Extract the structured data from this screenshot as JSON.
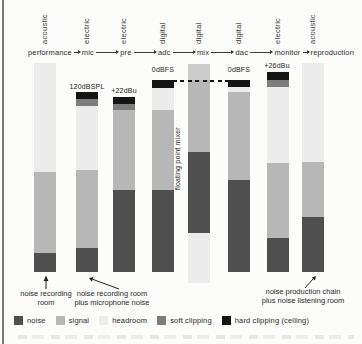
{
  "figure": {
    "background": "#fcfcfb",
    "floating_point_mixer_label": "floating point mixer"
  },
  "chart_data": {
    "type": "bar",
    "subtype": "stacked-level-diagram",
    "title": "",
    "categories": [
      "performance",
      "mic",
      "pre",
      "adc",
      "mix",
      "dac",
      "monitor",
      "reproduction"
    ],
    "domain_labels": [
      "acoustic",
      "electric",
      "electric",
      "digital",
      "digital",
      "digital",
      "electric",
      "acoustic"
    ],
    "legend_entries": [
      "noise",
      "signal",
      "headroom",
      "soft clipping",
      "hard clipping (ceiling)"
    ],
    "colors": {
      "noise": "#4f4f4f",
      "signal": "#b7b7b7",
      "headroom": "#ececec",
      "soft": "#7d7d7d",
      "hard": "#141414",
      "over": "#cccccc"
    },
    "bars": [
      {
        "stage": "performance",
        "x": 34,
        "width": 22,
        "annotation": null,
        "segments": [
          {
            "kind": "headroom",
            "top": 63,
            "bottom": 172
          },
          {
            "kind": "signal",
            "top": 172,
            "bottom": 253
          },
          {
            "kind": "noise",
            "top": 253,
            "bottom": 272
          }
        ]
      },
      {
        "stage": "mic",
        "x": 76,
        "width": 22,
        "annotation": {
          "label": "120dBSPL",
          "x": 87,
          "y": 83
        },
        "segments": [
          {
            "kind": "hard",
            "top": 92,
            "bottom": 99
          },
          {
            "kind": "soft",
            "top": 99,
            "bottom": 106
          },
          {
            "kind": "headroom",
            "top": 106,
            "bottom": 170
          },
          {
            "kind": "signal",
            "top": 170,
            "bottom": 248
          },
          {
            "kind": "noise",
            "top": 248,
            "bottom": 272
          }
        ]
      },
      {
        "stage": "pre",
        "x": 113,
        "width": 22,
        "annotation": {
          "label": "+22dBu",
          "x": 124,
          "y": 87
        },
        "segments": [
          {
            "kind": "hard",
            "top": 97,
            "bottom": 104
          },
          {
            "kind": "soft",
            "top": 104,
            "bottom": 110
          },
          {
            "kind": "signal",
            "top": 110,
            "bottom": 190
          },
          {
            "kind": "noise",
            "top": 190,
            "bottom": 272
          }
        ]
      },
      {
        "stage": "adc",
        "x": 152,
        "width": 22,
        "annotation": {
          "label": "0dBFS",
          "x": 163,
          "y": 66
        },
        "segments": [
          {
            "kind": "hard",
            "top": 80,
            "bottom": 88
          },
          {
            "kind": "headroom",
            "top": 88,
            "bottom": 110
          },
          {
            "kind": "signal",
            "top": 110,
            "bottom": 190
          },
          {
            "kind": "noise",
            "top": 190,
            "bottom": 272
          }
        ]
      },
      {
        "stage": "mix",
        "x": 188,
        "width": 22,
        "annotation": null,
        "segments": [
          {
            "kind": "over",
            "top": 64,
            "bottom": 80
          },
          {
            "kind": "signal",
            "top": 80,
            "bottom": 152
          },
          {
            "kind": "noise",
            "top": 152,
            "bottom": 233
          },
          {
            "kind": "headroom",
            "top": 233,
            "bottom": 283
          }
        ]
      },
      {
        "stage": "dac",
        "x": 228,
        "width": 22,
        "annotation": {
          "label": "0dBFS",
          "x": 239,
          "y": 66
        },
        "segments": [
          {
            "kind": "hard",
            "top": 80,
            "bottom": 87
          },
          {
            "kind": "headroom",
            "top": 87,
            "bottom": 92
          },
          {
            "kind": "signal",
            "top": 92,
            "bottom": 180
          },
          {
            "kind": "noise",
            "top": 180,
            "bottom": 272
          }
        ]
      },
      {
        "stage": "monitor",
        "x": 267,
        "width": 22,
        "annotation": {
          "label": "+26dBu",
          "x": 277,
          "y": 62
        },
        "segments": [
          {
            "kind": "hard",
            "top": 72,
            "bottom": 80
          },
          {
            "kind": "soft",
            "top": 80,
            "bottom": 87
          },
          {
            "kind": "headroom",
            "top": 87,
            "bottom": 163
          },
          {
            "kind": "signal",
            "top": 163,
            "bottom": 238
          },
          {
            "kind": "noise",
            "top": 238,
            "bottom": 272
          }
        ]
      },
      {
        "stage": "reproduction",
        "x": 302,
        "width": 22,
        "annotation": null,
        "segments": [
          {
            "kind": "headroom",
            "top": 63,
            "bottom": 162
          },
          {
            "kind": "signal",
            "top": 162,
            "bottom": 217
          },
          {
            "kind": "noise",
            "top": 217,
            "bottom": 272
          }
        ]
      }
    ],
    "reference_line": {
      "label": "0dBFS",
      "style": "dashed",
      "y": 80,
      "x1": 173,
      "x2": 228
    },
    "notes": {
      "floating_point_mixer": "floating point mixer",
      "arrow_notes": [
        {
          "lines": [
            "noise recording",
            "room"
          ],
          "x": 46,
          "y": 290
        },
        {
          "lines": [
            "noise recording room",
            "plus microphone noise"
          ],
          "x": 112,
          "y": 290
        },
        {
          "lines": [
            "noise production chain",
            "plus noise listening room"
          ],
          "x": 303,
          "y": 288
        }
      ]
    }
  },
  "legend": {
    "items": [
      {
        "label": "noise",
        "color": "#4f4f4f"
      },
      {
        "label": "signal",
        "color": "#b7b7b7"
      },
      {
        "label": "headroom",
        "color": "#ececec"
      },
      {
        "label": "soft clipping",
        "color": "#7d7d7d"
      },
      {
        "label": "hard clipping (ceiling)",
        "color": "#141414"
      }
    ]
  }
}
